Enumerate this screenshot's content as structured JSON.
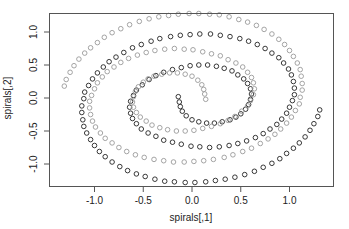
{
  "chart_data": {
    "type": "scatter",
    "title": "",
    "xlabel": "spirals[,1]",
    "ylabel": "spirals[,2]",
    "xlim": [
      -1.45,
      1.45
    ],
    "ylim": [
      -1.33,
      1.27
    ],
    "xticks": [
      -1.0,
      -0.5,
      0.0,
      0.5,
      1.0
    ],
    "xtick_labels": [
      "-1.0",
      "-0.5",
      "0.0",
      "0.5",
      "1.0"
    ],
    "yticks": [
      -1.0,
      -0.5,
      0.0,
      0.5,
      1.0
    ],
    "ytick_labels": [
      "-1.0",
      "-0.5",
      "0.0",
      "0.5",
      "1.0"
    ],
    "grid": false,
    "legend": null,
    "marker": "open-circle",
    "series": [
      {
        "name": "class 1",
        "color": "#222222",
        "points": [
          [
            -0.14,
            0.02
          ],
          [
            -0.13,
            -0.06
          ],
          [
            -0.12,
            -0.13
          ],
          [
            -0.1,
            -0.2
          ],
          [
            -0.06,
            -0.27
          ],
          [
            0.0,
            -0.33
          ],
          [
            0.07,
            -0.36
          ],
          [
            0.15,
            -0.38
          ],
          [
            0.23,
            -0.38
          ],
          [
            0.31,
            -0.36
          ],
          [
            0.39,
            -0.33
          ],
          [
            0.45,
            -0.29
          ],
          [
            0.5,
            -0.24
          ],
          [
            0.55,
            -0.17
          ],
          [
            0.58,
            -0.1
          ],
          [
            0.6,
            -0.02
          ],
          [
            0.61,
            0.06
          ],
          [
            0.6,
            0.14
          ],
          [
            0.57,
            0.22
          ],
          [
            0.53,
            0.29
          ],
          [
            0.47,
            0.35
          ],
          [
            0.41,
            0.41
          ],
          [
            0.33,
            0.45
          ],
          [
            0.25,
            0.48
          ],
          [
            0.16,
            0.5
          ],
          [
            0.07,
            0.5
          ],
          [
            -0.02,
            0.49
          ],
          [
            -0.11,
            0.46
          ],
          [
            -0.2,
            0.43
          ],
          [
            -0.29,
            0.39
          ],
          [
            -0.37,
            0.34
          ],
          [
            -0.44,
            0.28
          ],
          [
            -0.51,
            0.2
          ],
          [
            -0.57,
            0.12
          ],
          [
            -0.6,
            0.04
          ],
          [
            -0.63,
            -0.05
          ],
          [
            -0.64,
            -0.14
          ],
          [
            -0.63,
            -0.23
          ],
          [
            -0.61,
            -0.31
          ],
          [
            -0.57,
            -0.39
          ],
          [
            -0.52,
            -0.47
          ],
          [
            -0.45,
            -0.53
          ],
          [
            -0.37,
            -0.58
          ],
          [
            -0.29,
            -0.64
          ],
          [
            -0.2,
            -0.67
          ],
          [
            -0.11,
            -0.7
          ],
          [
            -0.01,
            -0.73
          ],
          [
            0.08,
            -0.74
          ],
          [
            0.18,
            -0.75
          ],
          [
            0.28,
            -0.74
          ],
          [
            0.38,
            -0.72
          ],
          [
            0.47,
            -0.69
          ],
          [
            0.56,
            -0.65
          ],
          [
            0.65,
            -0.6
          ],
          [
            0.73,
            -0.54
          ],
          [
            0.8,
            -0.47
          ],
          [
            0.87,
            -0.4
          ],
          [
            0.92,
            -0.32
          ],
          [
            0.97,
            -0.23
          ],
          [
            1.0,
            -0.14
          ],
          [
            1.03,
            -0.04
          ],
          [
            1.05,
            0.05
          ],
          [
            1.05,
            0.15
          ],
          [
            1.04,
            0.25
          ],
          [
            1.02,
            0.35
          ],
          [
            0.99,
            0.44
          ],
          [
            0.94,
            0.53
          ],
          [
            0.89,
            0.61
          ],
          [
            0.82,
            0.68
          ],
          [
            0.75,
            0.75
          ],
          [
            0.67,
            0.81
          ],
          [
            0.58,
            0.86
          ],
          [
            0.49,
            0.9
          ],
          [
            0.39,
            0.93
          ],
          [
            0.29,
            0.95
          ],
          [
            0.19,
            0.97
          ],
          [
            0.08,
            0.97
          ],
          [
            -0.02,
            0.96
          ],
          [
            -0.12,
            0.95
          ],
          [
            -0.22,
            0.93
          ],
          [
            -0.33,
            0.9
          ],
          [
            -0.42,
            0.86
          ],
          [
            -0.52,
            0.81
          ],
          [
            -0.61,
            0.76
          ],
          [
            -0.7,
            0.69
          ],
          [
            -0.78,
            0.62
          ],
          [
            -0.85,
            0.55
          ],
          [
            -0.91,
            0.47
          ],
          [
            -0.97,
            0.38
          ],
          [
            -1.02,
            0.29
          ],
          [
            -1.06,
            0.19
          ],
          [
            -1.1,
            0.09
          ],
          [
            -1.11,
            -0.01
          ],
          [
            -1.13,
            -0.12
          ],
          [
            -1.13,
            -0.22
          ],
          [
            -1.12,
            -0.33
          ],
          [
            -1.11,
            -0.43
          ],
          [
            -1.08,
            -0.53
          ],
          [
            -1.04,
            -0.63
          ],
          [
            -1.0,
            -0.72
          ],
          [
            -0.95,
            -0.81
          ],
          [
            -0.89,
            -0.89
          ],
          [
            -0.82,
            -0.97
          ],
          [
            -0.74,
            -1.04
          ],
          [
            -0.66,
            -1.1
          ],
          [
            -0.57,
            -1.15
          ],
          [
            -0.48,
            -1.19
          ],
          [
            -0.38,
            -1.23
          ],
          [
            -0.28,
            -1.26
          ],
          [
            -0.18,
            -1.27
          ],
          [
            -0.07,
            -1.28
          ],
          [
            0.03,
            -1.28
          ],
          [
            0.14,
            -1.27
          ],
          [
            0.24,
            -1.25
          ],
          [
            0.34,
            -1.23
          ],
          [
            0.44,
            -1.2
          ],
          [
            0.54,
            -1.16
          ],
          [
            0.64,
            -1.11
          ],
          [
            0.73,
            -1.05
          ],
          [
            0.82,
            -0.99
          ],
          [
            0.9,
            -0.92
          ],
          [
            0.97,
            -0.84
          ],
          [
            1.04,
            -0.76
          ],
          [
            1.1,
            -0.68
          ],
          [
            1.16,
            -0.59
          ],
          [
            1.21,
            -0.49
          ],
          [
            1.25,
            -0.39
          ],
          [
            1.29,
            -0.28
          ],
          [
            1.31,
            -0.18
          ]
        ]
      },
      {
        "name": "class 2",
        "color": "#9a9a9a",
        "points": [
          [
            0.14,
            -0.02
          ],
          [
            0.13,
            0.06
          ],
          [
            0.12,
            0.13
          ],
          [
            0.1,
            0.2
          ],
          [
            0.06,
            0.27
          ],
          [
            0.0,
            0.33
          ],
          [
            -0.07,
            0.36
          ],
          [
            -0.15,
            0.38
          ],
          [
            -0.23,
            0.38
          ],
          [
            -0.31,
            0.36
          ],
          [
            -0.39,
            0.33
          ],
          [
            -0.45,
            0.29
          ],
          [
            -0.5,
            0.24
          ],
          [
            -0.55,
            0.17
          ],
          [
            -0.58,
            0.1
          ],
          [
            -0.6,
            0.02
          ],
          [
            -0.61,
            -0.06
          ],
          [
            -0.6,
            -0.14
          ],
          [
            -0.57,
            -0.22
          ],
          [
            -0.53,
            -0.29
          ],
          [
            -0.47,
            -0.35
          ],
          [
            -0.41,
            -0.41
          ],
          [
            -0.33,
            -0.45
          ],
          [
            -0.25,
            -0.48
          ],
          [
            -0.16,
            -0.5
          ],
          [
            -0.07,
            -0.5
          ],
          [
            0.02,
            -0.49
          ],
          [
            0.11,
            -0.46
          ],
          [
            0.2,
            -0.43
          ],
          [
            0.29,
            -0.39
          ],
          [
            0.37,
            -0.34
          ],
          [
            0.44,
            -0.28
          ],
          [
            0.51,
            -0.2
          ],
          [
            0.57,
            -0.12
          ],
          [
            0.6,
            -0.04
          ],
          [
            0.63,
            0.05
          ],
          [
            0.64,
            0.14
          ],
          [
            0.63,
            0.23
          ],
          [
            0.61,
            0.31
          ],
          [
            0.57,
            0.39
          ],
          [
            0.52,
            0.47
          ],
          [
            0.45,
            0.53
          ],
          [
            0.37,
            0.58
          ],
          [
            0.29,
            0.64
          ],
          [
            0.2,
            0.67
          ],
          [
            0.11,
            0.7
          ],
          [
            0.01,
            0.73
          ],
          [
            -0.08,
            0.74
          ],
          [
            -0.18,
            0.75
          ],
          [
            -0.28,
            0.74
          ],
          [
            -0.38,
            0.72
          ],
          [
            -0.47,
            0.69
          ],
          [
            -0.56,
            0.65
          ],
          [
            -0.65,
            0.6
          ],
          [
            -0.73,
            0.54
          ],
          [
            -0.8,
            0.47
          ],
          [
            -0.87,
            0.4
          ],
          [
            -0.92,
            0.32
          ],
          [
            -0.97,
            0.23
          ],
          [
            -1.0,
            0.14
          ],
          [
            -1.03,
            0.04
          ],
          [
            -1.05,
            -0.05
          ],
          [
            -1.05,
            -0.15
          ],
          [
            -1.04,
            -0.25
          ],
          [
            -1.02,
            -0.35
          ],
          [
            -0.99,
            -0.44
          ],
          [
            -0.94,
            -0.53
          ],
          [
            -0.89,
            -0.61
          ],
          [
            -0.82,
            -0.68
          ],
          [
            -0.75,
            -0.75
          ],
          [
            -0.67,
            -0.81
          ],
          [
            -0.58,
            -0.86
          ],
          [
            -0.49,
            -0.9
          ],
          [
            -0.39,
            -0.93
          ],
          [
            -0.29,
            -0.95
          ],
          [
            -0.19,
            -0.97
          ],
          [
            -0.08,
            -0.97
          ],
          [
            0.02,
            -0.96
          ],
          [
            0.12,
            -0.95
          ],
          [
            0.22,
            -0.93
          ],
          [
            0.33,
            -0.9
          ],
          [
            0.42,
            -0.86
          ],
          [
            0.52,
            -0.81
          ],
          [
            0.61,
            -0.76
          ],
          [
            0.7,
            -0.69
          ],
          [
            0.78,
            -0.62
          ],
          [
            0.85,
            -0.55
          ],
          [
            0.91,
            -0.47
          ],
          [
            0.97,
            -0.38
          ],
          [
            1.02,
            -0.29
          ],
          [
            1.06,
            -0.19
          ],
          [
            1.1,
            -0.09
          ],
          [
            1.11,
            0.01
          ],
          [
            1.13,
            0.12
          ],
          [
            1.13,
            0.22
          ],
          [
            1.12,
            0.33
          ],
          [
            1.11,
            0.43
          ],
          [
            1.08,
            0.53
          ],
          [
            1.04,
            0.63
          ],
          [
            1.0,
            0.72
          ],
          [
            0.95,
            0.81
          ],
          [
            0.89,
            0.89
          ],
          [
            0.82,
            0.97
          ],
          [
            0.74,
            1.04
          ],
          [
            0.66,
            1.1
          ],
          [
            0.57,
            1.15
          ],
          [
            0.48,
            1.19
          ],
          [
            0.38,
            1.23
          ],
          [
            0.28,
            1.26
          ],
          [
            0.18,
            1.27
          ],
          [
            0.07,
            1.28
          ],
          [
            -0.03,
            1.28
          ],
          [
            -0.14,
            1.27
          ],
          [
            -0.24,
            1.25
          ],
          [
            -0.34,
            1.23
          ],
          [
            -0.44,
            1.2
          ],
          [
            -0.54,
            1.16
          ],
          [
            -0.64,
            1.11
          ],
          [
            -0.73,
            1.05
          ],
          [
            -0.82,
            0.99
          ],
          [
            -0.9,
            0.92
          ],
          [
            -0.97,
            0.84
          ],
          [
            -1.04,
            0.76
          ],
          [
            -1.1,
            0.68
          ],
          [
            -1.16,
            0.59
          ],
          [
            -1.21,
            0.49
          ],
          [
            -1.25,
            0.39
          ],
          [
            -1.29,
            0.28
          ],
          [
            -1.31,
            0.18
          ]
        ]
      }
    ]
  }
}
